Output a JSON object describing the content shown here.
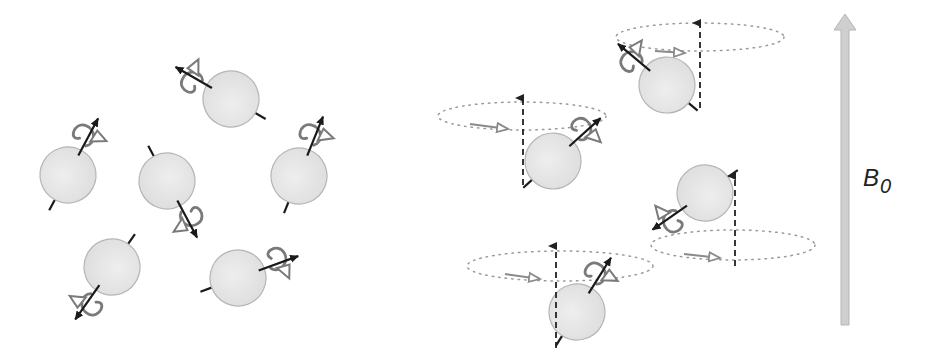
{
  "figure": {
    "colors": {
      "background": "#ffffff",
      "sphere_fill": "#e6e6e6",
      "sphere_stroke": "#b5b5b5",
      "spin_axis": "#1a1a1a",
      "rotation_loop": "#7a7a7a",
      "precession_path": "#9a9a9a",
      "field_arrow": "#cfcfcf",
      "field_arrow_stroke": "#b0b0b0"
    },
    "field": {
      "label_main": "B",
      "label_sub": "0"
    },
    "left_panel": {
      "title": "random-orientation",
      "spins": [
        {
          "cx": 68,
          "cy": 175,
          "angle": -62
        },
        {
          "cx": 231,
          "cy": 99,
          "angle": -150
        },
        {
          "cx": 167,
          "cy": 181,
          "angle": 62
        },
        {
          "cx": 299,
          "cy": 176,
          "angle": -68
        },
        {
          "cx": 112,
          "cy": 267,
          "angle": 125
        },
        {
          "cx": 238,
          "cy": 278,
          "angle": -20
        }
      ]
    },
    "right_panel": {
      "title": "aligned-precession",
      "spins": [
        {
          "cx": 553,
          "cy": 161,
          "angle": -42,
          "ellipse": {
            "cx": 522,
            "cy": 116,
            "rx": 84,
            "ry": 14
          },
          "axis_x": 523,
          "axis_top": 92,
          "axis_bottom": 185,
          "flow": {
            "x1": 470,
            "y1": 124,
            "x2": 508,
            "y2": 129
          }
        },
        {
          "cx": 667,
          "cy": 85,
          "angle": -140,
          "ellipse": {
            "cx": 700,
            "cy": 37,
            "rx": 84,
            "ry": 14
          },
          "axis_x": 700,
          "axis_top": 17,
          "axis_bottom": 108,
          "flow": {
            "x1": 655,
            "y1": 51,
            "x2": 685,
            "y2": 53
          }
        },
        {
          "cx": 705,
          "cy": 193,
          "angle": 145,
          "ellipse": {
            "cx": 733,
            "cy": 245,
            "rx": 82,
            "ry": 15
          },
          "axis_x": 735,
          "axis_top": 170,
          "axis_bottom": 266,
          "flow": {
            "x1": 684,
            "y1": 254,
            "x2": 720,
            "y2": 258
          }
        },
        {
          "cx": 577,
          "cy": 312,
          "angle": -58,
          "ellipse": {
            "cx": 560,
            "cy": 266,
            "rx": 93,
            "ry": 15
          },
          "axis_x": 556,
          "axis_top": 240,
          "axis_bottom": 348,
          "flow": {
            "x1": 505,
            "y1": 274,
            "x2": 540,
            "y2": 279
          }
        }
      ]
    }
  }
}
